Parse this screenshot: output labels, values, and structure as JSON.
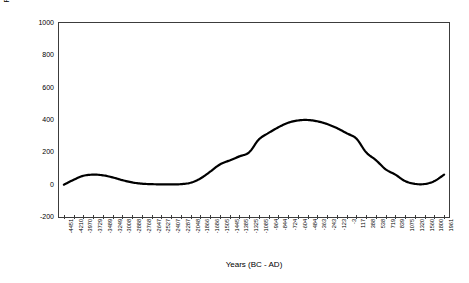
{
  "chart_data": {
    "type": "line",
    "title": "",
    "xlabel": "Years (BC - AD)",
    "ylabel": "Plantago Pollen Count",
    "ylim": [
      -200,
      1000
    ],
    "yticks": [
      1000,
      800,
      600,
      400,
      200,
      0,
      -200
    ],
    "grid": false,
    "legend": "none",
    "line_color": "#000000",
    "line_width": 2.2,
    "categories": [
      "-4451",
      "-4210",
      "-3970",
      "-3729",
      "-3489",
      "-3249",
      "-3008",
      "-2888",
      "-2768",
      "-2647",
      "-2527",
      "-2407",
      "-2287",
      "-2048",
      "-1866",
      "-1686",
      "-1505",
      "-1445",
      "-1385",
      "-1325",
      "-1085",
      "-964",
      "-844",
      "-724",
      "-604",
      "-484",
      "-363",
      "-243",
      "-123",
      "-3",
      "117",
      "388",
      "538",
      "719",
      "839",
      "1075",
      "1320",
      "1560",
      "1800",
      "1961"
    ],
    "values": [
      0,
      30,
      55,
      62,
      58,
      45,
      28,
      14,
      6,
      3,
      2,
      2,
      3,
      12,
      38,
      80,
      125,
      150,
      175,
      200,
      280,
      320,
      355,
      383,
      397,
      400,
      392,
      375,
      350,
      318,
      285,
      200,
      152,
      95,
      62,
      22,
      5,
      4,
      22,
      62
    ],
    "series_name": "Plantago Pollen Count"
  }
}
